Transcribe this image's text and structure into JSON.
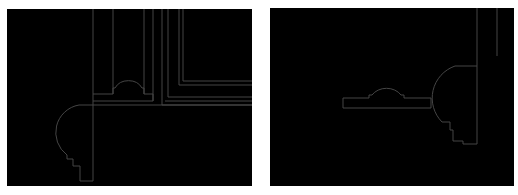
{
  "figure": {
    "line_color": "#4a4a4a",
    "background": "#000000",
    "panels": [
      {
        "id": "left",
        "label": ""
      },
      {
        "id": "right",
        "label": ""
      }
    ]
  }
}
